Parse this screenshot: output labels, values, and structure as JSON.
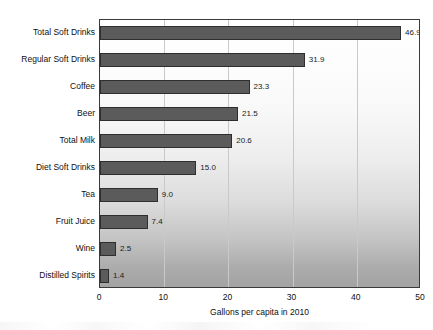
{
  "chart_data": {
    "type": "bar",
    "orientation": "horizontal",
    "title": "",
    "xlabel": "Gallons per capita in 2010",
    "ylabel": "",
    "xlim": [
      0,
      50
    ],
    "xticks": [
      "0",
      "10",
      "20",
      "30",
      "40",
      "50"
    ],
    "grid": true,
    "legend": "none",
    "categories": [
      "Total Soft Drinks",
      "Regular Soft Drinks",
      "Coffee",
      "Beer",
      "Total Milk",
      "Diet Soft Drinks",
      "Tea",
      "Fruit Juice",
      "Wine",
      "Distilled Spirits"
    ],
    "values": [
      46.9,
      31.9,
      23.3,
      21.5,
      20.6,
      15.0,
      9.0,
      7.4,
      2.5,
      1.4
    ],
    "value_labels": [
      "46.9",
      "31.9",
      "23.3",
      "21.5",
      "20.6",
      "15.0",
      "9.0",
      "7.4",
      "2.5",
      "1.4"
    ],
    "colors": {
      "bar_fill": "#5b5b5b",
      "bar_border": "#2e2e2e",
      "gridline": "#c9c9c9",
      "frame": "#3a3a3a",
      "text": "#101010"
    }
  }
}
